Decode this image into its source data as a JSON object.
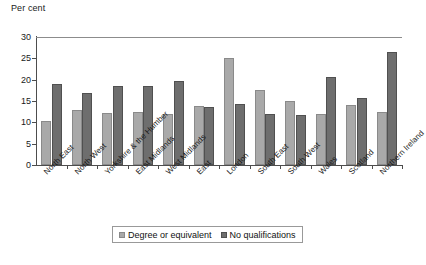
{
  "chart_data": {
    "type": "bar",
    "title": "",
    "ylabel": "Per cent",
    "xlabel": "",
    "ylim": [
      0,
      30
    ],
    "yticks": [
      0,
      5,
      10,
      15,
      20,
      25,
      30
    ],
    "grid": false,
    "legend_position": "bottom",
    "categories": [
      "North East",
      "North West",
      "Yorkshire & the Humber",
      "East Midlands",
      "West Midlands",
      "East",
      "London",
      "South East",
      "South West",
      "Wales",
      "Scotland",
      "Northern Ireland"
    ],
    "series": [
      {
        "name": "Degree or equivalent",
        "color": "#a9a9a9",
        "values": [
          10.3,
          12.8,
          12.1,
          12.5,
          11.9,
          13.8,
          25.0,
          17.6,
          15.1,
          12.0,
          14.0,
          12.5
        ]
      },
      {
        "name": "No qualifications",
        "color": "#6e6e6e",
        "values": [
          19.0,
          16.8,
          18.6,
          18.6,
          19.8,
          13.5,
          14.3,
          12.0,
          11.7,
          20.6,
          15.7,
          26.5
        ]
      }
    ]
  },
  "legend": {
    "entries": [
      {
        "label": "Degree or equivalent"
      },
      {
        "label": "No qualifications"
      }
    ]
  }
}
